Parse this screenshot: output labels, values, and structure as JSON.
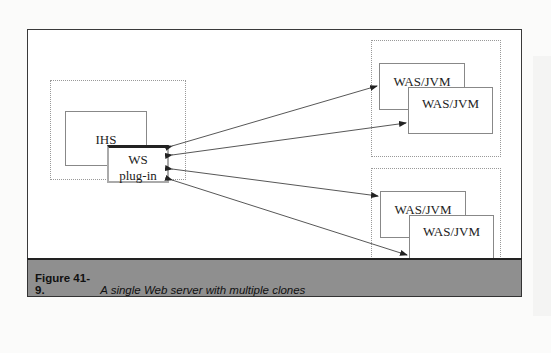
{
  "figure": {
    "caption_number": "Figure 41-9.",
    "caption_text": "A single Web server with multiple clones",
    "colors": {
      "caption_band": "#8f8f8f",
      "frame_border": "#3a3a3a",
      "arrow": "#333333"
    }
  },
  "diagram": {
    "web_server_group": {
      "ihs_label": "IHS",
      "plugin_label_line1": "WS",
      "plugin_label_line2": "plug-in"
    },
    "clone_group_top": {
      "clone1_label": "WAS/JVM",
      "clone2_label": "WAS/JVM"
    },
    "clone_group_bottom": {
      "clone1_label": "WAS/JVM",
      "clone2_label": "WAS/JVM"
    },
    "connections": [
      {
        "from": "WS plug-in",
        "to": "top WAS/JVM 1",
        "bidirectional": true
      },
      {
        "from": "WS plug-in",
        "to": "top WAS/JVM 2",
        "bidirectional": true
      },
      {
        "from": "WS plug-in",
        "to": "bottom WAS/JVM 1",
        "bidirectional": true
      },
      {
        "from": "WS plug-in",
        "to": "bottom WAS/JVM 2",
        "bidirectional": true
      }
    ]
  }
}
